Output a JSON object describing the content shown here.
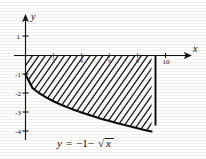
{
  "figure": {
    "name": "region-under-curve-plot",
    "equation_label": "y = −1 − √x",
    "equation_parts": {
      "lhs": "y",
      "equals": "=",
      "rhs_lead": "−1−",
      "radical": "√",
      "radicand": "x"
    },
    "x_axis_label": "x",
    "y_axis_label": "y"
  },
  "chart_data": {
    "type": "area",
    "title": "",
    "subtitle": "",
    "xlabel": "x",
    "ylabel": "y",
    "xlim": [
      -0.6,
      11.2
    ],
    "ylim": [
      -4.6,
      1.8
    ],
    "grid": false,
    "legend": null,
    "x_ticks": [
      2,
      4,
      6,
      8,
      10
    ],
    "x_tick_labels": [
      "2",
      "4",
      "6",
      "8",
      "10"
    ],
    "y_ticks": [
      1,
      -1,
      -2,
      -3,
      -4
    ],
    "y_tick_labels": [
      "1",
      "-1",
      "-2",
      "-3",
      "-4"
    ],
    "series": [
      {
        "name": "y = -1 - sqrt(x)",
        "expression": "y = -1 - sqrt(x)",
        "type": "line",
        "x": [
          0,
          0.5,
          1,
          1.5,
          2,
          2.5,
          3,
          3.5,
          4,
          4.5,
          5,
          5.5,
          6,
          6.5,
          7,
          7.5,
          8,
          8.5,
          9
        ],
        "y": [
          -1.0,
          -1.71,
          -2.0,
          -2.22,
          -2.41,
          -2.58,
          -2.73,
          -2.87,
          -3.0,
          -3.12,
          -3.24,
          -3.35,
          -3.45,
          -3.55,
          -3.65,
          -3.74,
          -3.83,
          -3.92,
          -4.0
        ]
      }
    ],
    "shaded_region": {
      "label": "hatched area between curve and x-axis",
      "x_from": 0,
      "x_to": 9,
      "upper_bound": "y = 0 (x-axis)",
      "lower_bound": "y = -1 - sqrt(x)",
      "fill": "diagonal-hatching",
      "hatch_angle_deg": 55
    },
    "boundaries": [
      {
        "name": "x-axis",
        "type": "horizontal",
        "value": 0
      },
      {
        "name": "y-axis",
        "type": "vertical",
        "value": 0
      },
      {
        "name": "right-edge",
        "type": "vertical",
        "value": 9
      }
    ],
    "annotations": [
      {
        "text": "y = -1 - √x",
        "x": 3.6,
        "y": -4.35
      }
    ],
    "colors": {
      "curve": "#0a0a0a",
      "axis": "#111111",
      "hatch": "#141414",
      "background": "#fdfdfb"
    }
  }
}
